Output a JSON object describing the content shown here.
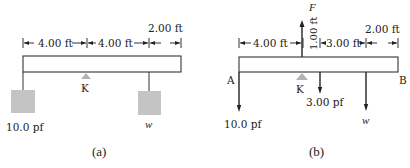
{
  "figure_a": {
    "caption": "(a)",
    "dimensions": [
      {
        "label": "4.00 ft"
      },
      {
        "label": "4.00 ft"
      },
      {
        "label": "2.00 ft"
      }
    ],
    "pivot_label": "K",
    "left_weight_label": "10.0 pf",
    "right_weight_label": "w",
    "colors": {
      "mass_fill": "#c4c4c4",
      "support_fill": "#b3b3b3"
    }
  },
  "figure_b": {
    "caption": "(b)",
    "force_label": "F",
    "dimensions": [
      {
        "label": "4.00 ft"
      },
      {
        "label": "1.00 ft"
      },
      {
        "label": "3.00 ft"
      },
      {
        "label": "2.00 ft"
      }
    ],
    "end_left_label": "A",
    "end_right_label": "B",
    "pivot_label": "K",
    "beam_weight_label": "3.00 pf",
    "left_force_label": "10.0 pf",
    "right_force_label": "w"
  }
}
